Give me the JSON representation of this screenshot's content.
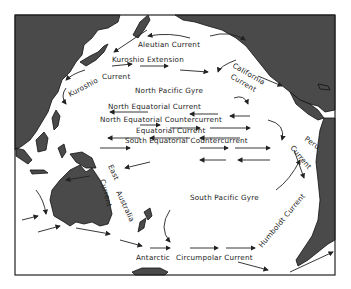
{
  "map": {
    "title": "Pacific Ocean Surface Currents",
    "colors": {
      "land": "#4a4a4a",
      "ocean": "#ffffff",
      "ink": "#222222"
    },
    "labels": {
      "aleutian": "Aleutian Current",
      "kuroshio_ext": "Kuroshio Extension",
      "kuroshio_a": "Kuroshio",
      "kuroshio_b": "Current",
      "california_a": "California",
      "california_b": "Current",
      "north_gyre": "North Pacific Gyre",
      "north_eq": "North Equatorial Current",
      "north_eq_counter": "North Equatorial Countercurrent",
      "equatorial": "Equatorial Current",
      "south_eq_counter": "South Equatorial Countercurrent",
      "peru_a": "Peru",
      "peru_b": "Current",
      "east_aus_a": "East",
      "east_aus_b": "Australia",
      "east_aus_c": "Current",
      "south_gyre": "South Pacific Gyre",
      "humboldt": "Humboldt Current",
      "antarctic_a": "Antarctic",
      "antarctic_b": "Circumpolar Current"
    }
  }
}
